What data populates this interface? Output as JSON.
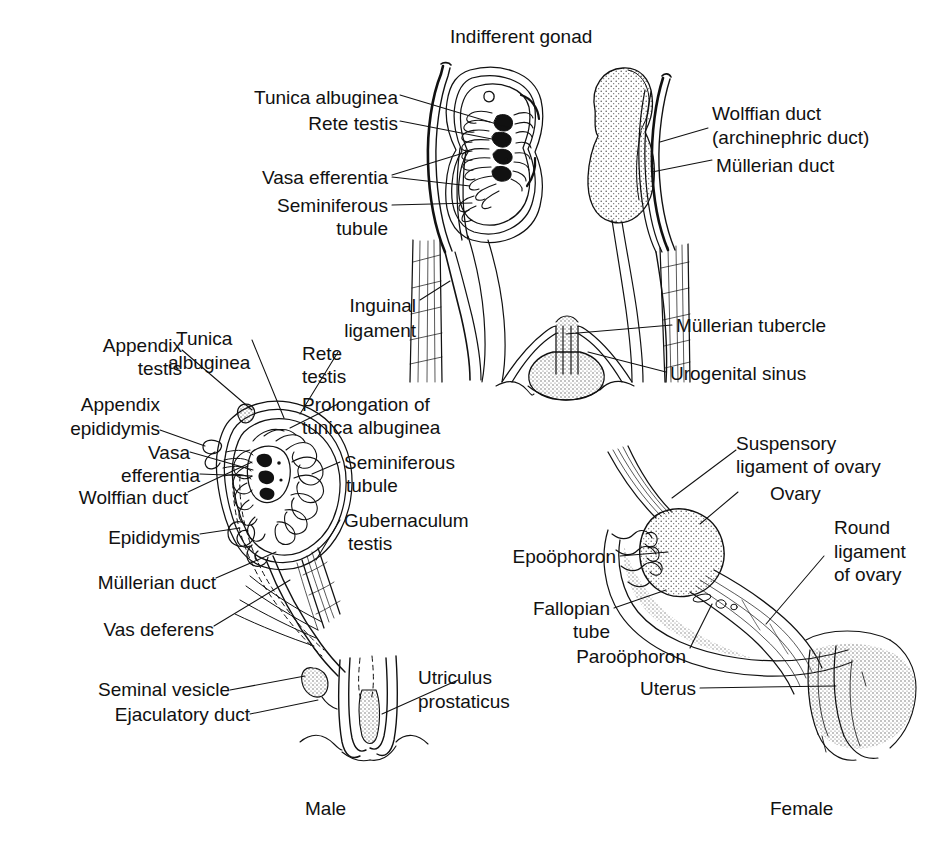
{
  "figure": {
    "title": "Indifferent gonad",
    "captions": {
      "male": "Male",
      "female": "Female"
    }
  },
  "panels": {
    "indifferent": {
      "name": "Indifferent gonad",
      "left_labels": [
        {
          "id": "tunica-albuginea",
          "text": "Tunica albuginea"
        },
        {
          "id": "rete-testis",
          "text": "Rete testis"
        },
        {
          "id": "vasa-efferentia",
          "text": "Vasa efferentia"
        },
        {
          "id": "seminiferous-tubule-1",
          "text": "Seminiferous"
        },
        {
          "id": "seminiferous-tubule-2",
          "text": "tubule"
        },
        {
          "id": "inguinal-ligament-1",
          "text": "Inguinal"
        },
        {
          "id": "inguinal-ligament-2",
          "text": "ligament"
        }
      ],
      "right_labels": [
        {
          "id": "wolffian-duct",
          "text": "Wolffian duct"
        },
        {
          "id": "archinephric-duct",
          "text": "(archinephric duct)"
        },
        {
          "id": "mullerian-duct",
          "text": "Müllerian duct"
        },
        {
          "id": "mullerian-tubercle",
          "text": "Müllerian tubercle"
        },
        {
          "id": "urogenital-sinus",
          "text": "Urogenital sinus"
        }
      ]
    },
    "male": {
      "name": "Male",
      "left_labels": [
        {
          "id": "appendix-testis-1",
          "text": "Appendix"
        },
        {
          "id": "appendix-testis-2",
          "text": "testis"
        },
        {
          "id": "tunica-albuginea-1",
          "text": "Tunica"
        },
        {
          "id": "tunica-albuginea-2",
          "text": "albuginea"
        },
        {
          "id": "appendix-epididymis-1",
          "text": "Appendix"
        },
        {
          "id": "appendix-epididymis-2",
          "text": "epididymis"
        },
        {
          "id": "vasa-efferentia-1",
          "text": "Vasa"
        },
        {
          "id": "vasa-efferentia-2",
          "text": "efferentia"
        },
        {
          "id": "wolffian-duct",
          "text": "Wolffian duct"
        },
        {
          "id": "epididymis",
          "text": "Epididymis"
        },
        {
          "id": "mullerian-duct",
          "text": "Müllerian duct"
        },
        {
          "id": "vas-deferens",
          "text": "Vas deferens"
        },
        {
          "id": "seminal-vesicle",
          "text": "Seminal vesicle"
        },
        {
          "id": "ejaculatory-duct",
          "text": "Ejaculatory duct"
        }
      ],
      "right_labels": [
        {
          "id": "rete-testis-1",
          "text": "Rete"
        },
        {
          "id": "rete-testis-2",
          "text": "testis"
        },
        {
          "id": "prolongation-1",
          "text": "Prolongation of"
        },
        {
          "id": "prolongation-2",
          "text": "tunica albuginea"
        },
        {
          "id": "seminiferous-tubule-1",
          "text": "Seminiferous"
        },
        {
          "id": "seminiferous-tubule-2",
          "text": "tubule"
        },
        {
          "id": "gubernaculum-testis-1",
          "text": "Gubernaculum"
        },
        {
          "id": "gubernaculum-testis-2",
          "text": "testis"
        },
        {
          "id": "utriculus-prostaticus-1",
          "text": "Utriculus"
        },
        {
          "id": "utriculus-prostaticus-2",
          "text": "prostaticus"
        }
      ]
    },
    "female": {
      "name": "Female",
      "labels": [
        {
          "id": "suspensory-ligament-1",
          "text": "Suspensory"
        },
        {
          "id": "suspensory-ligament-2",
          "text": "ligament of ovary"
        },
        {
          "id": "ovary",
          "text": "Ovary"
        },
        {
          "id": "round-ligament-1",
          "text": "Round"
        },
        {
          "id": "round-ligament-2",
          "text": "ligament"
        },
        {
          "id": "round-ligament-3",
          "text": "of ovary"
        },
        {
          "id": "epoophoron",
          "text": "Epoöphoron"
        },
        {
          "id": "fallopian-tube-1",
          "text": "Fallopian"
        },
        {
          "id": "fallopian-tube-2",
          "text": "tube"
        },
        {
          "id": "paroophoron",
          "text": "Paroöphoron"
        },
        {
          "id": "uterus",
          "text": "Uterus"
        }
      ]
    }
  },
  "colors": {
    "ink": "#111111",
    "paper": "#ffffff",
    "stipple": "#4a4a4a"
  }
}
